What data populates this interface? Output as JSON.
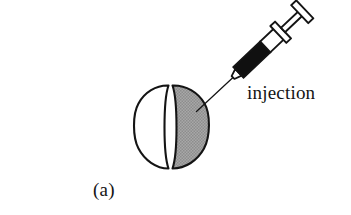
{
  "figure": {
    "panel_label": "(a)",
    "caption_text": "injection",
    "width": 351,
    "height": 215,
    "background_color": "#ffffff",
    "ink_color": "#141414"
  },
  "diagram": {
    "type": "schematic-illustration",
    "elements": [
      {
        "name": "embryo",
        "label": "",
        "description": "oval cell divided into a white left lobe and a shaded right lobe",
        "bbox": [
          133,
          84,
          75,
          86
        ]
      },
      {
        "name": "embryo-left-lobe",
        "fill_color": "#ffffff",
        "stroke_color": "#141414"
      },
      {
        "name": "embryo-right-lobe",
        "fill_color": "#9c9c9c",
        "stroke_color": "#141414"
      },
      {
        "name": "syringe",
        "description": "hypodermic syringe angled at about 45 degrees, barrel partly filled black",
        "barrel_fill_color": "#101010",
        "barrel_empty_color": "#ffffff",
        "stroke_color": "#141414"
      },
      {
        "name": "needle",
        "description": "thin needle entering the shaded lobe of the embryo"
      }
    ]
  },
  "colors": {
    "ink": "#141414",
    "shade": "#9c9c9c",
    "shade_light": "#a9a9a9",
    "fill_black": "#101010",
    "white": "#ffffff"
  }
}
